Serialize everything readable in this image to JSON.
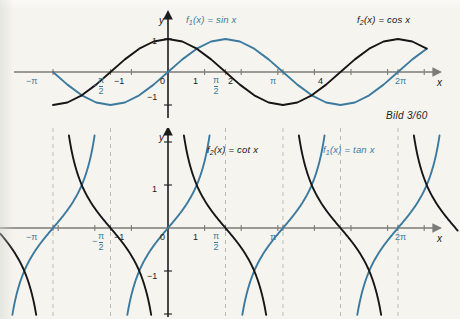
{
  "caption": {
    "text": "Bild 3/60"
  },
  "colors": {
    "background": "#f5f4ef",
    "curve_blue": "#3b7a9e",
    "curve_black": "#161616",
    "axis_gray": "#7b7b78",
    "asymptote_gray": "#b9bdb7",
    "label_black": "#1c1c1c",
    "label_blue": "#3b7a9e"
  },
  "charts": [
    {
      "id": "sin-cos-chart",
      "type": "line",
      "title": "",
      "xlabel": "x",
      "ylabel": "y",
      "xlim": [
        -3.95,
        7.25
      ],
      "ylim": [
        -1.5,
        1.5
      ],
      "grid": false,
      "legend_position": "inside-top",
      "series": [
        {
          "name": "f₁(x) = sin x",
          "fn": "sin",
          "color": "#3b7a9e",
          "label_main": "f",
          "label_sub": "1",
          "label_rest": "(x) = sin x"
        },
        {
          "name": "f₂(x) = cos x",
          "fn": "cos",
          "color": "#161616",
          "label_main": "f",
          "label_sub": "2",
          "label_rest": "(x) = cos x"
        }
      ],
      "x_ticks": [
        {
          "value": -3.14159,
          "label": "−π",
          "style": "blue"
        },
        {
          "value": -1.5708,
          "label": "−π/2",
          "style": "blue-frac"
        },
        {
          "value": -1,
          "label": "−1",
          "style": "plain"
        },
        {
          "value": 0,
          "label": "0",
          "style": "origin"
        },
        {
          "value": 1,
          "label": "1",
          "style": "plain"
        },
        {
          "value": 1.5708,
          "label": "π/2",
          "style": "blue-frac"
        },
        {
          "value": 2,
          "label": "2",
          "style": "plain"
        },
        {
          "value": 3.14159,
          "label": "π",
          "style": "blue"
        },
        {
          "value": 4,
          "label": "4",
          "style": "plain"
        },
        {
          "value": 6.28319,
          "label": "2π",
          "style": "blue"
        }
      ],
      "y_ticks": [
        {
          "value": 1,
          "label": "1"
        },
        {
          "value": -1,
          "label": "−1"
        }
      ]
    },
    {
      "id": "tan-cot-chart",
      "type": "line",
      "title": "",
      "xlabel": "x",
      "ylabel": "y",
      "xlim": [
        -3.95,
        7.25
      ],
      "ylim": [
        -2.6,
        2.6
      ],
      "grid": false,
      "legend_position": "inside-top",
      "series": [
        {
          "name": "f₂(x) = cot x",
          "fn": "cot",
          "color": "#161616",
          "label_main": "f",
          "label_sub": "2",
          "label_rest": "(x) = cot x"
        },
        {
          "name": "f₁(x) = tan x",
          "fn": "tan",
          "color": "#3b7a9e",
          "label_main": "f",
          "label_sub": "1",
          "label_rest": "(x) = tan x"
        }
      ],
      "asymptotes": [
        -3.14159,
        -1.5708,
        1.5708,
        3.14159,
        4.71239,
        6.28319
      ],
      "x_ticks": [
        {
          "value": -3.14159,
          "label": "−π",
          "style": "blue"
        },
        {
          "value": -1.5708,
          "label": "−π/2",
          "style": "blue-frac"
        },
        {
          "value": -1,
          "label": "−1",
          "style": "plain"
        },
        {
          "value": 0,
          "label": "0",
          "style": "origin"
        },
        {
          "value": 1,
          "label": "1",
          "style": "plain"
        },
        {
          "value": 1.5708,
          "label": "π/2",
          "style": "blue-frac"
        },
        {
          "value": 3.14159,
          "label": "π",
          "style": "blue"
        },
        {
          "value": 6.28319,
          "label": "2π",
          "style": "blue"
        }
      ],
      "y_ticks": [
        {
          "value": 1,
          "label": "1"
        },
        {
          "value": -1,
          "label": "−1"
        }
      ]
    }
  ],
  "chart_data": {
    "type": "line",
    "title": "",
    "subtitle": "Bild 3/60",
    "xlabel": "x",
    "ylabel": "y",
    "grid": false,
    "panels": [
      {
        "name": "top-panel-sin-cos",
        "xlim": [
          -3.95,
          7.25
        ],
        "ylim": [
          -1.5,
          1.5
        ],
        "x_tick_labels": [
          "−π",
          "−π/2",
          "−1",
          "0",
          "1",
          "π/2",
          "2",
          "π",
          "4",
          "2π"
        ],
        "x_tick_values": [
          -3.14159,
          -1.5708,
          -1,
          0,
          1,
          1.5708,
          2,
          3.14159,
          4,
          6.28319
        ],
        "y_tick_labels": [
          "1",
          "−1"
        ],
        "y_tick_values": [
          1,
          -1
        ],
        "legend": [
          "f₁(x) = sin x",
          "f₂(x) = cos x"
        ],
        "series": [
          {
            "name": "f₁(x) = sin x",
            "color": "#3b7a9e",
            "x": [
              -3.1416,
              -2.7489,
              -2.3562,
              -1.9635,
              -1.5708,
              -1.1781,
              -0.7854,
              -0.3927,
              0,
              0.3927,
              0.7854,
              1.1781,
              1.5708,
              1.9635,
              2.3562,
              2.7489,
              3.1416,
              3.5343,
              3.927,
              4.3197,
              4.7124,
              5.1051,
              5.4978,
              5.8905,
              6.2832,
              6.6759,
              7.0686
            ],
            "y": [
              0,
              -0.3827,
              -0.7071,
              -0.9239,
              -1,
              -0.9239,
              -0.7071,
              -0.3827,
              0,
              0.3827,
              0.7071,
              0.9239,
              1,
              0.9239,
              0.7071,
              0.3827,
              0,
              -0.3827,
              -0.7071,
              -0.9239,
              -1,
              -0.9239,
              -0.7071,
              -0.3827,
              0,
              0.3827,
              0.7071
            ]
          },
          {
            "name": "f₂(x) = cos x",
            "color": "#161616",
            "x": [
              -3.1416,
              -2.7489,
              -2.3562,
              -1.9635,
              -1.5708,
              -1.1781,
              -0.7854,
              -0.3927,
              0,
              0.3927,
              0.7854,
              1.1781,
              1.5708,
              1.9635,
              2.3562,
              2.7489,
              3.1416,
              3.5343,
              3.927,
              4.3197,
              4.7124,
              5.1051,
              5.4978,
              5.8905,
              6.2832,
              6.6759,
              7.0686
            ],
            "y": [
              -1,
              -0.9239,
              -0.7071,
              -0.3827,
              0,
              0.3827,
              0.7071,
              0.9239,
              1,
              0.9239,
              0.7071,
              0.3827,
              0,
              -0.3827,
              -0.7071,
              -0.9239,
              -1,
              -0.9239,
              -0.7071,
              -0.3827,
              0,
              0.3827,
              0.7071,
              0.9239,
              1,
              0.9239,
              0.7071
            ]
          }
        ]
      },
      {
        "name": "bottom-panel-tan-cot",
        "xlim": [
          -3.95,
          7.25
        ],
        "ylim": [
          -2.6,
          2.6
        ],
        "x_tick_labels": [
          "−π",
          "−π/2",
          "−1",
          "0",
          "1",
          "π/2",
          "π",
          "2π"
        ],
        "x_tick_values": [
          -3.14159,
          -1.5708,
          -1,
          0,
          1,
          1.5708,
          3.14159,
          6.28319
        ],
        "y_tick_labels": [
          "1",
          "−1"
        ],
        "y_tick_values": [
          1,
          -1
        ],
        "legend": [
          "f₂(x) = cot x",
          "f₁(x) = tan x"
        ],
        "asymptotes_x": [
          -3.14159,
          -1.5708,
          1.5708,
          3.14159,
          4.71239,
          6.28319
        ],
        "series": [
          {
            "name": "f₁(x) = tan x",
            "color": "#3b7a9e",
            "period": 3.14159,
            "zeros": [
              -3.14159,
              0,
              3.14159,
              6.28319
            ],
            "poles": [
              -1.5708,
              1.5708,
              4.71239
            ]
          },
          {
            "name": "f₂(x) = cot x",
            "color": "#161616",
            "period": 3.14159,
            "zeros": [
              -1.5708,
              1.5708,
              4.71239
            ],
            "poles": [
              -3.14159,
              0,
              3.14159,
              6.28319
            ]
          }
        ]
      }
    ]
  }
}
